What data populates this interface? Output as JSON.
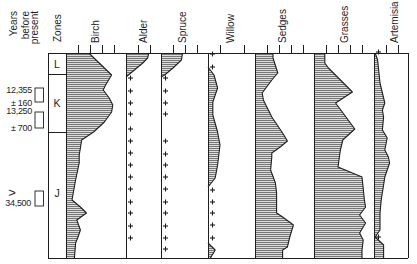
{
  "header": {
    "years_label": [
      "Years",
      "before",
      "present"
    ],
    "zones_label": "Zones"
  },
  "colors": {
    "background": "#ffffff",
    "ink": "#1e1e1e",
    "hatch_fill": "#dcdcdc",
    "hatch_line": "#555555"
  },
  "chart_data": {
    "type": "area",
    "title": "",
    "xlabel": "",
    "ylabel": "Years before present",
    "value_unit": "percent (estimated; unlabeled ticks every 10%)",
    "depth_range": [
      0,
      205
    ],
    "grid": false,
    "zones": [
      {
        "label": "L",
        "depth": [
          0,
          21
        ]
      },
      {
        "label": "K",
        "depth": [
          21,
          79
        ]
      },
      {
        "label": "J",
        "depth": [
          79,
          205
        ]
      }
    ],
    "radiocarbon_dates": [
      {
        "age": "12,355",
        "error": "± 160",
        "depth_range": [
          35,
          49
        ]
      },
      {
        "age": "13,250",
        "error": "± 700",
        "depth_range": [
          59,
          75
        ]
      },
      {
        "age": "34,500",
        "qualifier": ">",
        "depth_range": [
          138,
          153
        ]
      }
    ],
    "series": [
      {
        "name": "Birch",
        "ticks_pct": [
          10,
          20,
          30,
          40
        ],
        "profile_segments": [
          [
            [
              0,
              19
            ],
            [
              22,
              38
            ],
            [
              32,
              33
            ],
            [
              37,
              31
            ],
            [
              45,
              36
            ],
            [
              52,
              39
            ],
            [
              59,
              38
            ],
            [
              69,
              32
            ],
            [
              79,
              23
            ],
            [
              87,
              13
            ],
            [
              95,
              12
            ],
            [
              102,
              11
            ],
            [
              110,
              11
            ],
            [
              127,
              8
            ],
            [
              147,
              5
            ],
            [
              154,
              12
            ],
            [
              160,
              17
            ],
            [
              167,
              9
            ],
            [
              177,
              12
            ],
            [
              184,
              10
            ],
            [
              190,
              8
            ],
            [
              205,
              7
            ]
          ]
        ],
        "presence_depths": []
      },
      {
        "name": "Alder",
        "ticks_pct": [
          10,
          20
        ],
        "profile_segments": [
          [
            [
              0,
              19
            ],
            [
              5,
              18
            ],
            [
              10,
              14
            ],
            [
              21,
              3
            ],
            [
              24,
              0
            ]
          ]
        ],
        "presence_depths": [
          25,
          38,
          50,
          61,
          76,
          88,
          100,
          112,
          124,
          136,
          149,
          160,
          173,
          185
        ]
      },
      {
        "name": "Spruce",
        "ticks_pct": [
          10,
          20,
          30
        ],
        "profile_segments": [
          [
            [
              0,
              18
            ],
            [
              7,
              17
            ],
            [
              15,
              10
            ],
            [
              22,
              3
            ],
            [
              24,
              0
            ]
          ]
        ],
        "presence_depths": [
          25,
          38,
          50,
          61,
          88,
          101,
          112,
          124,
          136,
          149,
          160,
          173,
          185,
          196
        ]
      },
      {
        "name": "Willow",
        "ticks_pct": [
          10,
          30
        ],
        "profile_segments": [
          [
            [
              14,
              0
            ],
            [
              22,
              5
            ],
            [
              35,
              8
            ],
            [
              49,
              4
            ],
            [
              62,
              4
            ],
            [
              79,
              8
            ],
            [
              92,
              10
            ],
            [
              112,
              8
            ],
            [
              125,
              6
            ],
            [
              134,
              0
            ]
          ],
          [
            [
              190,
              0
            ],
            [
              197,
              6
            ],
            [
              205,
              2
            ]
          ]
        ],
        "presence_depths": [
          1,
          14,
          137,
          149,
          160,
          172,
          185
        ]
      },
      {
        "name": "Sedges",
        "ticks_pct": [
          10,
          20,
          30,
          40
        ],
        "profile_segments": [
          [
            [
              0,
              15
            ],
            [
              5,
              15
            ],
            [
              20,
              19
            ],
            [
              27,
              14
            ],
            [
              40,
              6
            ],
            [
              47,
              7
            ],
            [
              64,
              14
            ],
            [
              80,
              23
            ],
            [
              88,
              27
            ],
            [
              94,
              21
            ],
            [
              100,
              14
            ],
            [
              104,
              14
            ],
            [
              117,
              13
            ],
            [
              130,
              17
            ],
            [
              140,
              18
            ],
            [
              160,
              18
            ],
            [
              164,
              23
            ],
            [
              172,
              32
            ],
            [
              184,
              29
            ],
            [
              194,
              27
            ],
            [
              197,
              23
            ],
            [
              205,
              23
            ]
          ]
        ],
        "presence_depths": []
      },
      {
        "name": "Grasses",
        "ticks_pct": [
          10,
          20,
          30,
          40
        ],
        "profile_segments": [
          [
            [
              0,
              9
            ],
            [
              10,
              9
            ],
            [
              15,
              12
            ],
            [
              39,
              32
            ],
            [
              50,
              18
            ],
            [
              76,
              34
            ],
            [
              87,
              24
            ],
            [
              97,
              22
            ],
            [
              114,
              20
            ],
            [
              124,
              40
            ],
            [
              147,
              42
            ],
            [
              154,
              43
            ],
            [
              162,
              38
            ],
            [
              170,
              43
            ],
            [
              180,
              38
            ],
            [
              187,
              41
            ],
            [
              197,
              40
            ],
            [
              205,
              40
            ]
          ]
        ],
        "presence_depths": []
      },
      {
        "name": "Artemisia",
        "ticks_pct": [
          10,
          20
        ],
        "profile_segments": [
          [
            [
              0,
              1
            ],
            [
              7,
              3
            ],
            [
              30,
              5
            ],
            [
              50,
              9
            ],
            [
              57,
              7
            ],
            [
              64,
              8
            ],
            [
              77,
              7
            ],
            [
              85,
              11
            ],
            [
              97,
              9
            ],
            [
              104,
              12
            ],
            [
              110,
              13
            ],
            [
              124,
              9
            ],
            [
              132,
              8
            ],
            [
              147,
              6
            ],
            [
              160,
              5
            ],
            [
              177,
              5
            ],
            [
              184,
              1
            ],
            [
              192,
              8
            ],
            [
              205,
              8
            ]
          ]
        ],
        "presence_depths": [
          -1,
          184
        ]
      }
    ]
  }
}
